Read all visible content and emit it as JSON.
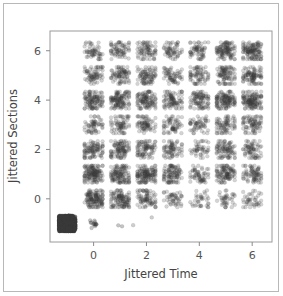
{
  "chart_data": {
    "type": "scatter",
    "title": "",
    "xlabel": "Jittered Time",
    "ylabel": "Jittered Sections",
    "xlim": [
      -1.65,
      6.75
    ],
    "ylim": [
      -1.75,
      6.8
    ],
    "xticks": [
      0,
      2,
      4,
      6
    ],
    "xticklabels": [
      "0",
      "2",
      "4",
      "6"
    ],
    "yticks": [
      0,
      2,
      4,
      6
    ],
    "yticklabels": [
      "0",
      "2",
      "4",
      "6"
    ],
    "grid": false,
    "legend": null,
    "point_color": "#3a3a3a",
    "point_opacity": 0.22,
    "point_radius": 1.9,
    "jitter_spread": 0.34,
    "clusters": [
      {
        "x": 0,
        "y": 6,
        "n": 55
      },
      {
        "x": 1,
        "y": 6,
        "n": 70
      },
      {
        "x": 2,
        "y": 6,
        "n": 75
      },
      {
        "x": 3,
        "y": 6,
        "n": 60
      },
      {
        "x": 4,
        "y": 6,
        "n": 62
      },
      {
        "x": 5,
        "y": 6,
        "n": 110
      },
      {
        "x": 6,
        "y": 6,
        "n": 125
      },
      {
        "x": 0,
        "y": 5,
        "n": 72
      },
      {
        "x": 1,
        "y": 5,
        "n": 80
      },
      {
        "x": 2,
        "y": 5,
        "n": 85
      },
      {
        "x": 3,
        "y": 5,
        "n": 62
      },
      {
        "x": 4,
        "y": 5,
        "n": 70
      },
      {
        "x": 5,
        "y": 5,
        "n": 90
      },
      {
        "x": 6,
        "y": 5,
        "n": 95
      },
      {
        "x": 0,
        "y": 4,
        "n": 110
      },
      {
        "x": 1,
        "y": 4,
        "n": 118
      },
      {
        "x": 2,
        "y": 4,
        "n": 108
      },
      {
        "x": 3,
        "y": 4,
        "n": 88
      },
      {
        "x": 4,
        "y": 4,
        "n": 92
      },
      {
        "x": 5,
        "y": 4,
        "n": 125
      },
      {
        "x": 6,
        "y": 4,
        "n": 130
      },
      {
        "x": 0,
        "y": 3,
        "n": 58
      },
      {
        "x": 1,
        "y": 3,
        "n": 68
      },
      {
        "x": 2,
        "y": 3,
        "n": 72
      },
      {
        "x": 3,
        "y": 3,
        "n": 60
      },
      {
        "x": 4,
        "y": 3,
        "n": 55
      },
      {
        "x": 5,
        "y": 3,
        "n": 75
      },
      {
        "x": 6,
        "y": 3,
        "n": 80
      },
      {
        "x": 0,
        "y": 2,
        "n": 95
      },
      {
        "x": 1,
        "y": 2,
        "n": 100
      },
      {
        "x": 2,
        "y": 2,
        "n": 85
      },
      {
        "x": 3,
        "y": 2,
        "n": 72
      },
      {
        "x": 4,
        "y": 2,
        "n": 45
      },
      {
        "x": 5,
        "y": 2,
        "n": 88
      },
      {
        "x": 6,
        "y": 2,
        "n": 70
      },
      {
        "x": 0,
        "y": 1,
        "n": 140
      },
      {
        "x": 1,
        "y": 1,
        "n": 120
      },
      {
        "x": 2,
        "y": 1,
        "n": 135
      },
      {
        "x": 3,
        "y": 1,
        "n": 100
      },
      {
        "x": 4,
        "y": 1,
        "n": 60
      },
      {
        "x": 5,
        "y": 1,
        "n": 105
      },
      {
        "x": 6,
        "y": 1,
        "n": 80
      },
      {
        "x": 0,
        "y": 0,
        "n": 130
      },
      {
        "x": 1,
        "y": 0,
        "n": 112
      },
      {
        "x": 2,
        "y": 0,
        "n": 78
      },
      {
        "x": 3,
        "y": 0,
        "n": 48
      },
      {
        "x": 4,
        "y": 0,
        "n": 35
      },
      {
        "x": 5,
        "y": 0,
        "n": 40
      },
      {
        "x": 6,
        "y": 0,
        "n": 42
      },
      {
        "x": -1,
        "y": -1,
        "n": 400,
        "spread": 0.3,
        "opacity": 0.75
      },
      {
        "x": 0,
        "y": -1,
        "n": 14,
        "spread": 0.2,
        "opacity": 0.3
      },
      {
        "x": 1,
        "y": -1.1,
        "n": 2,
        "spread": 0.08,
        "opacity": 0.3
      },
      {
        "x": 1.5,
        "y": -1.1,
        "n": 1,
        "spread": 0.05,
        "opacity": 0.25
      },
      {
        "x": 2.15,
        "y": -0.75,
        "n": 1,
        "spread": 0.05,
        "opacity": 0.25
      }
    ]
  },
  "axes": {
    "x_title": "Jittered Time",
    "y_title": "Jittered Sections"
  }
}
